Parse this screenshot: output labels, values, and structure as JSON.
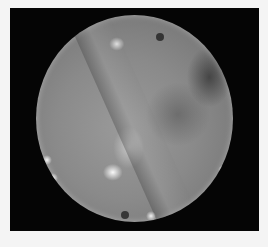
{
  "image": {
    "description": "Grayscale circular endoscopic/fundus-style photograph on a black square background with light margins",
    "colors": {
      "margin": "#f4f4f4",
      "frame": "#050505",
      "disc_mid": "#8a8a8a",
      "highlight": "#ffffff"
    }
  }
}
